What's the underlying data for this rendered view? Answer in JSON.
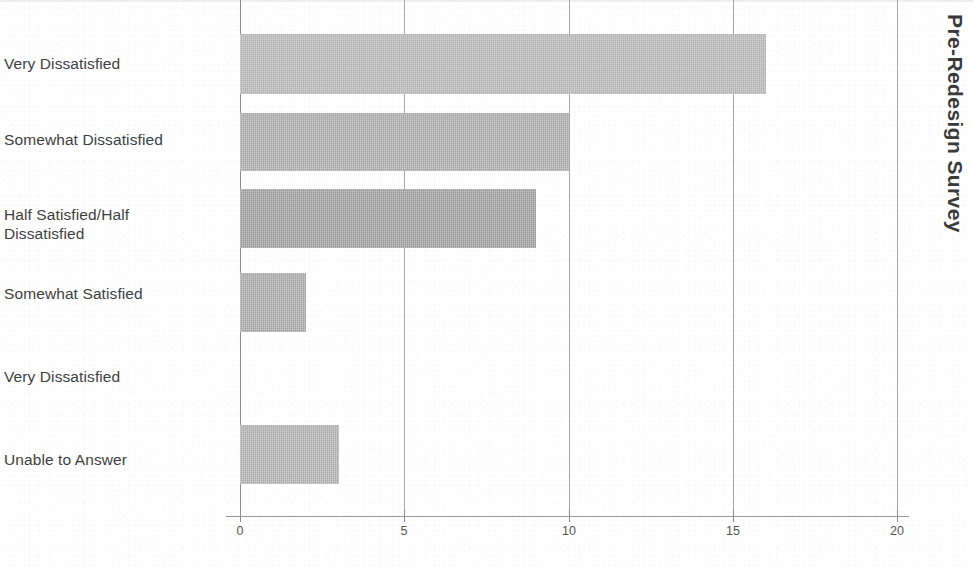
{
  "chart_data": {
    "type": "bar",
    "orientation": "horizontal",
    "title": "Pre-Redesign Survey",
    "xlabel": "",
    "ylabel": "",
    "xlim": [
      0,
      20
    ],
    "xticks": [
      0,
      5,
      10,
      15,
      20
    ],
    "xtick_labels": [
      "0",
      "5",
      "10",
      "15",
      "20"
    ],
    "grid": "vertical",
    "legend": "none",
    "bar_color": "#bfbfbf",
    "categories": [
      "Very Dissatisfied",
      "Somewhat Dissatisfied",
      "Half Satisfied/Half Dissatisfied",
      "Somewhat Satisfied",
      "Very Dissatisfied",
      "Unable to Answer"
    ],
    "values": [
      16,
      10,
      9,
      2,
      0,
      3
    ]
  },
  "labels": {
    "cat0": "Very Dissatisfied",
    "cat1": "Somewhat Dissatisfied",
    "cat2_line1": "Half Satisfied/Half",
    "cat2_line2": "Dissatisfied",
    "cat3": "Somewhat Satisfied",
    "cat4": "Very Dissatisfied",
    "cat5": "Unable to Answer"
  },
  "axis": {
    "tick0": "0",
    "tick1": "5",
    "tick2": "10",
    "tick3": "15",
    "tick4": "20"
  },
  "title": {
    "text": "Pre-Redesign Survey"
  }
}
